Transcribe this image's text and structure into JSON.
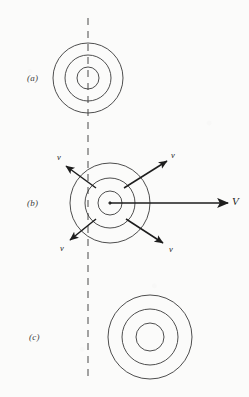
{
  "figure": {
    "background_color": "#fbfbfa",
    "stroke_color": "#3a3a3a",
    "arrow_color": "#1d1d1d",
    "reference_line": {
      "name": "vertical dashed reference line",
      "style": "dashed",
      "x": 88,
      "y_top": 18,
      "y_bottom": 376,
      "color": "#8c8c8c"
    },
    "panels": [
      {
        "label": "(a)",
        "label_x": 27,
        "label_y": 73,
        "description": "stationary source, concentric wavefronts centred on the reference line",
        "center_x": 88,
        "center_y": 78,
        "radii": [
          11,
          23,
          35
        ]
      },
      {
        "label": "(b)",
        "label_x": 27,
        "label_y": 198,
        "description": "source moving to the right with speed V, wavefronts expanding at speed v",
        "center_x": 110,
        "center_y": 203,
        "radii": [
          12,
          25,
          40
        ]
      },
      {
        "label": "(c)",
        "label_x": 29,
        "label_y": 332,
        "description": "wavefronts entirely to the right of the reference line",
        "center_x": 150,
        "center_y": 337,
        "radii": [
          14,
          28,
          42
        ]
      }
    ],
    "vectors": [
      {
        "name": "wave-speed-arrow-upper-left",
        "label": "v",
        "size": "small",
        "x1": 96,
        "y1": 188,
        "x2": 66,
        "y2": 166,
        "label_x": 57,
        "label_y": 152
      },
      {
        "name": "wave-speed-arrow-upper-right",
        "label": "v",
        "size": "small",
        "x1": 124,
        "y1": 188,
        "x2": 167,
        "y2": 161,
        "label_x": 171,
        "label_y": 150
      },
      {
        "name": "wave-speed-arrow-lower-left",
        "label": "v",
        "size": "small",
        "x1": 96,
        "y1": 219,
        "x2": 70,
        "y2": 240,
        "label_x": 60,
        "label_y": 243
      },
      {
        "name": "wave-speed-arrow-lower-right",
        "label": "v",
        "size": "small",
        "x1": 126,
        "y1": 219,
        "x2": 163,
        "y2": 243,
        "label_x": 169,
        "label_y": 244
      },
      {
        "name": "source-velocity-arrow",
        "label": "V",
        "size": "big",
        "x1": 110,
        "y1": 203,
        "x2": 228,
        "y2": 203,
        "label_x": 232,
        "label_y": 196
      }
    ]
  }
}
